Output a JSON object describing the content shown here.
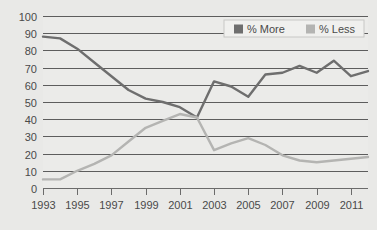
{
  "chart_data": {
    "type": "line",
    "title": "",
    "xlabel": "",
    "ylabel": "",
    "ylim": [
      0,
      100
    ],
    "ytick_step": 10,
    "yticks": [
      0,
      10,
      20,
      30,
      40,
      50,
      60,
      70,
      80,
      90,
      100
    ],
    "xlim": [
      1993,
      2012
    ],
    "xticks": [
      1993,
      1995,
      1997,
      1999,
      2001,
      2003,
      2005,
      2007,
      2009,
      2011
    ],
    "xtick_labels": [
      "1993",
      "1995",
      "1997",
      "1999",
      "2001",
      "2003",
      "2005",
      "2007",
      "2009",
      "2011"
    ],
    "grid": true,
    "legend_position": "top-right",
    "x": [
      1993,
      1994,
      1995,
      1996,
      1997,
      1998,
      1999,
      2000,
      2001,
      2002,
      2003,
      2004,
      2005,
      2006,
      2007,
      2008,
      2009,
      2010,
      2011,
      2012
    ],
    "series": [
      {
        "name": "% More",
        "color": "#6e6e6e",
        "values": [
          88,
          87,
          81,
          73,
          65,
          57,
          52,
          50,
          47,
          41,
          62,
          59,
          53,
          66,
          67,
          71,
          67,
          74,
          65,
          68
        ]
      },
      {
        "name": "% Less",
        "color": "#b4b4b2",
        "values": [
          5,
          5,
          10,
          14,
          19,
          27,
          35,
          39,
          43,
          41,
          22,
          26,
          29,
          25,
          19,
          16,
          15,
          16,
          17,
          18
        ]
      }
    ]
  },
  "legend": {
    "items": [
      {
        "label": "% More",
        "color": "#6e6e6e"
      },
      {
        "label": "% Less",
        "color": "#b4b4b2"
      }
    ]
  },
  "axis": {
    "y_labels": [
      "100",
      "90",
      "80",
      "70",
      "60",
      "50",
      "40",
      "30",
      "20",
      "10",
      "0"
    ],
    "x_labels": [
      "1993",
      "1995",
      "1997",
      "1999",
      "2001",
      "2003",
      "2005",
      "2007",
      "2009",
      "2011"
    ]
  },
  "colors": {
    "background": "#e9e9e7",
    "plot_background": "#ebebe9",
    "grid": "#5d5d5d",
    "axis": "#6b6b6b",
    "text": "#4a4a4a",
    "series_more": "#6e6e6e",
    "series_less": "#b4b4b2"
  }
}
